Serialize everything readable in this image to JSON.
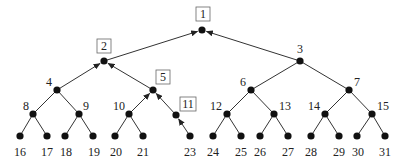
{
  "diagram": {
    "type": "binary-tree",
    "colors": {
      "edge": "#333333",
      "node": "#111111",
      "label": "#222222",
      "box_stroke": "#666666"
    },
    "nodes": [
      {
        "id": "1",
        "x": 202,
        "y": 30,
        "label": "1",
        "boxed": true,
        "lx": 203,
        "ly": 18
      },
      {
        "id": "2",
        "x": 104,
        "y": 61,
        "label": "2",
        "boxed": true,
        "lx": 104,
        "ly": 50
      },
      {
        "id": "3",
        "x": 300,
        "y": 61,
        "label": "3",
        "boxed": false,
        "lx": 300,
        "ly": 53
      },
      {
        "id": "4",
        "x": 57,
        "y": 90,
        "label": "4",
        "boxed": false,
        "lx": 49,
        "ly": 86
      },
      {
        "id": "5",
        "x": 153,
        "y": 90,
        "label": "5",
        "boxed": true,
        "lx": 163,
        "ly": 81
      },
      {
        "id": "6",
        "x": 251,
        "y": 90,
        "label": "6",
        "boxed": false,
        "lx": 243,
        "ly": 86
      },
      {
        "id": "7",
        "x": 349,
        "y": 90,
        "label": "7",
        "boxed": false,
        "lx": 357,
        "ly": 86
      },
      {
        "id": "8",
        "x": 33,
        "y": 114,
        "label": "8",
        "boxed": false,
        "lx": 26,
        "ly": 110
      },
      {
        "id": "9",
        "x": 79,
        "y": 114,
        "label": "9",
        "boxed": false,
        "lx": 86,
        "ly": 110
      },
      {
        "id": "10",
        "x": 129,
        "y": 114,
        "label": "10",
        "boxed": false,
        "lx": 119,
        "ly": 110
      },
      {
        "id": "11",
        "x": 176,
        "y": 115,
        "label": "11",
        "boxed": true,
        "lx": 188,
        "ly": 108
      },
      {
        "id": "12",
        "x": 227,
        "y": 114,
        "label": "12",
        "boxed": false,
        "lx": 216,
        "ly": 110
      },
      {
        "id": "13",
        "x": 274,
        "y": 114,
        "label": "13",
        "boxed": false,
        "lx": 285,
        "ly": 110
      },
      {
        "id": "14",
        "x": 325,
        "y": 114,
        "label": "14",
        "boxed": false,
        "lx": 314,
        "ly": 110
      },
      {
        "id": "15",
        "x": 372,
        "y": 114,
        "label": "15",
        "boxed": false,
        "lx": 383,
        "ly": 110
      },
      {
        "id": "16",
        "x": 20,
        "y": 136,
        "label": "16",
        "boxed": false,
        "lx": 20,
        "ly": 156
      },
      {
        "id": "17",
        "x": 47,
        "y": 136,
        "label": "17",
        "boxed": false,
        "lx": 47,
        "ly": 156
      },
      {
        "id": "18",
        "x": 65,
        "y": 136,
        "label": "18",
        "boxed": false,
        "lx": 66,
        "ly": 156
      },
      {
        "id": "19",
        "x": 93,
        "y": 136,
        "label": "19",
        "boxed": false,
        "lx": 94,
        "ly": 156
      },
      {
        "id": "20",
        "x": 115,
        "y": 136,
        "label": "20",
        "boxed": false,
        "lx": 116,
        "ly": 156
      },
      {
        "id": "21",
        "x": 143,
        "y": 136,
        "label": "21",
        "boxed": false,
        "lx": 143,
        "ly": 156
      },
      {
        "id": "23",
        "x": 190,
        "y": 136,
        "label": "23",
        "boxed": false,
        "lx": 190,
        "ly": 156
      },
      {
        "id": "24",
        "x": 213,
        "y": 136,
        "label": "24",
        "boxed": false,
        "lx": 213,
        "ly": 156
      },
      {
        "id": "25",
        "x": 241,
        "y": 136,
        "label": "25",
        "boxed": false,
        "lx": 241,
        "ly": 156
      },
      {
        "id": "26",
        "x": 260,
        "y": 136,
        "label": "26",
        "boxed": false,
        "lx": 260,
        "ly": 156
      },
      {
        "id": "27",
        "x": 288,
        "y": 136,
        "label": "27",
        "boxed": false,
        "lx": 288,
        "ly": 156
      },
      {
        "id": "28",
        "x": 311,
        "y": 136,
        "label": "28",
        "boxed": false,
        "lx": 311,
        "ly": 156
      },
      {
        "id": "29",
        "x": 339,
        "y": 136,
        "label": "29",
        "boxed": false,
        "lx": 339,
        "ly": 156
      },
      {
        "id": "30",
        "x": 357,
        "y": 136,
        "label": "30",
        "boxed": false,
        "lx": 358,
        "ly": 156
      },
      {
        "id": "31",
        "x": 385,
        "y": 136,
        "label": "31",
        "boxed": false,
        "lx": 385,
        "ly": 156
      }
    ],
    "edges": [
      {
        "from": "2",
        "to": "1",
        "arrow": true
      },
      {
        "from": "3",
        "to": "1",
        "arrow": true
      },
      {
        "from": "4",
        "to": "2",
        "arrow": true
      },
      {
        "from": "5",
        "to": "2",
        "arrow": true
      },
      {
        "from": "6",
        "to": "3",
        "arrow": false
      },
      {
        "from": "7",
        "to": "3",
        "arrow": false
      },
      {
        "from": "8",
        "to": "4",
        "arrow": false
      },
      {
        "from": "9",
        "to": "4",
        "arrow": false
      },
      {
        "from": "10",
        "to": "5",
        "arrow": true
      },
      {
        "from": "11",
        "to": "5",
        "arrow": true
      },
      {
        "from": "12",
        "to": "6",
        "arrow": false
      },
      {
        "from": "13",
        "to": "6",
        "arrow": false
      },
      {
        "from": "14",
        "to": "7",
        "arrow": false
      },
      {
        "from": "15",
        "to": "7",
        "arrow": false
      },
      {
        "from": "16",
        "to": "8",
        "arrow": false
      },
      {
        "from": "17",
        "to": "8",
        "arrow": false
      },
      {
        "from": "18",
        "to": "9",
        "arrow": false
      },
      {
        "from": "19",
        "to": "9",
        "arrow": false
      },
      {
        "from": "20",
        "to": "10",
        "arrow": false
      },
      {
        "from": "21",
        "to": "10",
        "arrow": false
      },
      {
        "from": "23",
        "to": "11",
        "arrow": true
      },
      {
        "from": "24",
        "to": "12",
        "arrow": false
      },
      {
        "from": "25",
        "to": "12",
        "arrow": false
      },
      {
        "from": "26",
        "to": "13",
        "arrow": false
      },
      {
        "from": "27",
        "to": "13",
        "arrow": false
      },
      {
        "from": "28",
        "to": "14",
        "arrow": false
      },
      {
        "from": "29",
        "to": "14",
        "arrow": false
      },
      {
        "from": "30",
        "to": "15",
        "arrow": false
      },
      {
        "from": "31",
        "to": "15",
        "arrow": false
      }
    ]
  }
}
